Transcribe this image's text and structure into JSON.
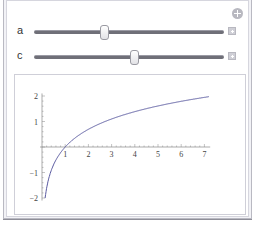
{
  "controls": {
    "add_button_icon": "circle-plus-icon",
    "sliders": [
      {
        "label": "a",
        "position_pct": 37
      },
      {
        "label": "c",
        "position_pct": 53
      }
    ],
    "expand_icon": "plus-square-icon"
  },
  "chart_data": {
    "type": "line",
    "title": "",
    "xlabel": "",
    "ylabel": "",
    "x_ticks": [
      "1",
      "2",
      "3",
      "4",
      "5",
      "6",
      "7"
    ],
    "y_ticks": [
      "-2",
      "-1",
      "1",
      "2"
    ],
    "xlim": [
      0,
      7.2
    ],
    "ylim": [
      -2.1,
      2.1
    ],
    "grid": false,
    "series": [
      {
        "name": "curve",
        "color": "#5a5aa0",
        "x": [
          0.135,
          0.2,
          0.3,
          0.5,
          0.75,
          1,
          1.5,
          2,
          3,
          4,
          5,
          6,
          7.2
        ],
        "y": [
          -2.0,
          -1.61,
          -1.2,
          -0.69,
          -0.29,
          0,
          0.41,
          0.69,
          1.1,
          1.39,
          1.61,
          1.79,
          1.97
        ]
      }
    ]
  }
}
